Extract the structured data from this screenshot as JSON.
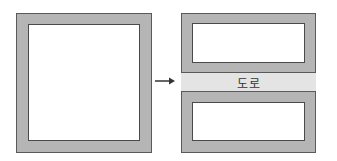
{
  "diagram": {
    "before": {
      "label": ""
    },
    "arrow": {
      "icon": "right-arrow-icon"
    },
    "after": {
      "road_label": "도로"
    }
  },
  "colors": {
    "wall": "#b5b5b5",
    "road": "#e4e4e4",
    "outline": "#5a5a5a"
  }
}
